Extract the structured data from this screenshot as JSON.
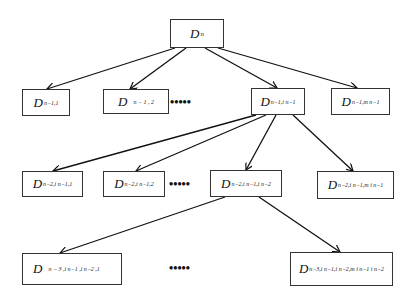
{
  "diagram": {
    "type": "tree",
    "nodes": {
      "root": {
        "main": "D",
        "sub": "n"
      },
      "l1_1": {
        "main": "D",
        "sub": "n−1,1"
      },
      "l1_2": {
        "main": "D",
        "sub": "n − 1 , 2"
      },
      "l1_3": {
        "main": "D",
        "sub": "n−1,i n−1"
      },
      "l1_4": {
        "main": "D",
        "sub": "n−1,m n−1"
      },
      "l2_1": {
        "main": "D",
        "sub": "n−2,i n−1,1"
      },
      "l2_2": {
        "main": "D",
        "sub": "n−2,i n−1,2"
      },
      "l2_3": {
        "main": "D",
        "sub": "n−2,i n−1,i n−2"
      },
      "l2_4": {
        "main": "D",
        "sub": "n−2,i n−1,m i n−1"
      },
      "l3_1": {
        "main": "D",
        "sub": "n − 3 ,i n−1 ,i n−2 ,1"
      },
      "l3_2": {
        "main": "D",
        "sub": "n−3,i n−1,i n−2,m i n−1 i n−2"
      }
    },
    "ellipsis": "•••••",
    "edges": [
      [
        "root",
        "l1_1"
      ],
      [
        "root",
        "l1_2"
      ],
      [
        "root",
        "l1_3"
      ],
      [
        "root",
        "l1_4"
      ],
      [
        "l1_3",
        "l2_1"
      ],
      [
        "l1_3",
        "l2_2"
      ],
      [
        "l1_3",
        "l2_3"
      ],
      [
        "l1_3",
        "l2_4"
      ],
      [
        "l2_3",
        "l3_1"
      ],
      [
        "l2_3",
        "l3_2"
      ]
    ]
  }
}
